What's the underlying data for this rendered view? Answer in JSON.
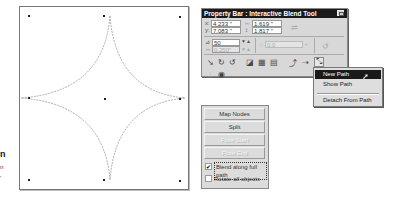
{
  "margin_text": [
    "n",
    "n",
    "'"
  ],
  "canvas": {
    "shape": "four-pointed-star-path",
    "node_count": 9
  },
  "property_bar": {
    "title": "Property Bar : Interactive Blend Tool",
    "close_icon": "close-icon",
    "x_label": "x:",
    "x_value": "4.233 \"",
    "y_label": "y:",
    "y_value": "7.083 \"",
    "width_label": "↔",
    "width_value": "1.619 \"",
    "height_label": "↕",
    "height_value": "1.817 \"",
    "steps_value": "50",
    "spacing_value": "0.250\"",
    "direction_value": "0.0",
    "toolbar_icons": [
      "blend-direction-icon",
      "clockwise-blend-icon",
      "counterclockwise-blend-icon",
      "object-color-acceleration-icon",
      "blend-properties-icon",
      "start-end-properties-icon",
      "path-properties-icon",
      "misc-blend-options-icon",
      "path-menu-icon"
    ],
    "bottom_icons": [
      "copy-blend-icon",
      "clear-blend-icon"
    ]
  },
  "path_menu": {
    "items": [
      {
        "label": "New Path",
        "selected": true
      },
      {
        "label": "Show Path",
        "selected": false
      },
      {
        "label": "Detach From Path",
        "selected": false
      }
    ]
  },
  "blend_panel": {
    "buttons": [
      {
        "label": "Map Nodes",
        "enabled": true
      },
      {
        "label": "Split",
        "enabled": true
      },
      {
        "label": "Fuse Start",
        "enabled": false
      },
      {
        "label": "Fuse End",
        "enabled": false
      }
    ],
    "checkboxes": [
      {
        "label": "Blend along full path",
        "checked": true
      },
      {
        "label": "Rotate all objects",
        "checked": false
      }
    ]
  }
}
